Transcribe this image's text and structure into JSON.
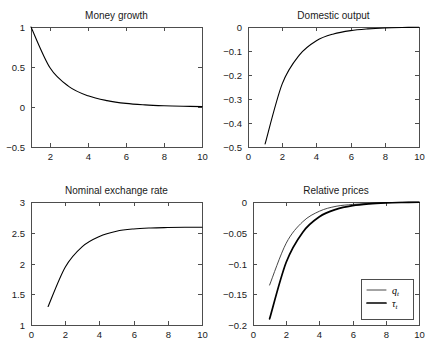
{
  "figure": {
    "background": "#ffffff",
    "line_color": "#000000",
    "axis_color": "#4d4d4d",
    "layout": "2x2 grid of impulse response panels"
  },
  "chart_data": [
    {
      "type": "line",
      "panel": "top-left",
      "title": "Money growth",
      "xlabel": "",
      "ylabel": "",
      "xlim": [
        1,
        10
      ],
      "ylim": [
        -0.5,
        1
      ],
      "grid": false,
      "legend": null,
      "xticks": [
        2,
        4,
        6,
        8,
        10
      ],
      "xticklabels": [
        "2",
        "4",
        "6",
        "8",
        "10"
      ],
      "yticks": [
        -0.5,
        0,
        0.5,
        1
      ],
      "yticklabels": [
        "-0.5",
        "0",
        "0.5",
        "1"
      ],
      "x": [
        1,
        2,
        3,
        4,
        5,
        6,
        7,
        8,
        9,
        10
      ],
      "values": [
        1.0,
        0.49,
        0.255,
        0.14,
        0.08,
        0.045,
        0.027,
        0.016,
        0.009,
        0.005
      ]
    },
    {
      "type": "line",
      "panel": "top-right",
      "title": "Domestic output",
      "xlabel": "",
      "ylabel": "",
      "xlim": [
        0,
        10
      ],
      "ylim": [
        -0.5,
        0
      ],
      "grid": false,
      "legend": null,
      "xticks": [
        0,
        2,
        4,
        6,
        8,
        10
      ],
      "xticklabels": [
        "0",
        "2",
        "4",
        "6",
        "8",
        "10"
      ],
      "yticks": [
        -0.5,
        -0.4,
        -0.3,
        -0.2,
        -0.1,
        0
      ],
      "yticklabels": [
        "-0.5",
        "-0.4",
        "-0.3",
        "-0.2",
        "-0.1",
        "0"
      ],
      "x": [
        1,
        2,
        3,
        4,
        5,
        6,
        7,
        8,
        9,
        10
      ],
      "values": [
        -0.487,
        -0.237,
        -0.117,
        -0.057,
        -0.029,
        -0.015,
        -0.008,
        -0.004,
        -0.002,
        -0.001
      ]
    },
    {
      "type": "line",
      "panel": "bottom-left",
      "title": "Nominal exchange rate",
      "xlabel": "",
      "ylabel": "",
      "xlim": [
        0,
        10
      ],
      "ylim": [
        1,
        3
      ],
      "grid": false,
      "legend": null,
      "xticks": [
        0,
        2,
        4,
        6,
        8,
        10
      ],
      "xticklabels": [
        "0",
        "2",
        "4",
        "6",
        "8",
        "10"
      ],
      "yticks": [
        1,
        1.5,
        2,
        2.5,
        3
      ],
      "yticklabels": [
        "1",
        "1.5",
        "2",
        "2.5",
        "3"
      ],
      "x": [
        1,
        2,
        3,
        4,
        5,
        6,
        7,
        8,
        9,
        10
      ],
      "values": [
        1.3,
        1.94,
        2.275,
        2.44,
        2.525,
        2.562,
        2.578,
        2.585,
        2.589,
        2.59
      ]
    },
    {
      "type": "line",
      "panel": "bottom-right",
      "title": "Relative prices",
      "xlabel": "",
      "ylabel": "",
      "xlim": [
        0,
        10
      ],
      "ylim": [
        -0.2,
        0
      ],
      "grid": false,
      "legend": {
        "position": "lower-right",
        "entries": [
          {
            "label": "q",
            "subscript": "t",
            "style": "thin"
          },
          {
            "label": "τ",
            "subscript": "t",
            "style": "thick"
          }
        ]
      },
      "xticks": [
        0,
        2,
        4,
        6,
        8,
        10
      ],
      "xticklabels": [
        "0",
        "2",
        "4",
        "6",
        "8",
        "10"
      ],
      "yticks": [
        -0.2,
        -0.15,
        -0.1,
        -0.05,
        0
      ],
      "yticklabels": [
        "-0.2",
        "-0.15",
        "-0.1",
        "-0.05",
        "0"
      ],
      "x": [
        1,
        2,
        3,
        4,
        5,
        6,
        7,
        8,
        9,
        10
      ],
      "series": [
        {
          "name": "q_t",
          "style": "thin",
          "values": [
            -0.135,
            -0.067,
            -0.032,
            -0.015,
            -0.007,
            -0.004,
            -0.002,
            -0.001,
            -0.0005,
            -0.0002
          ]
        },
        {
          "name": "tau_t",
          "style": "thick",
          "values": [
            -0.19,
            -0.098,
            -0.049,
            -0.024,
            -0.012,
            -0.006,
            -0.003,
            -0.0015,
            -0.0008,
            -0.0004
          ]
        }
      ]
    }
  ]
}
